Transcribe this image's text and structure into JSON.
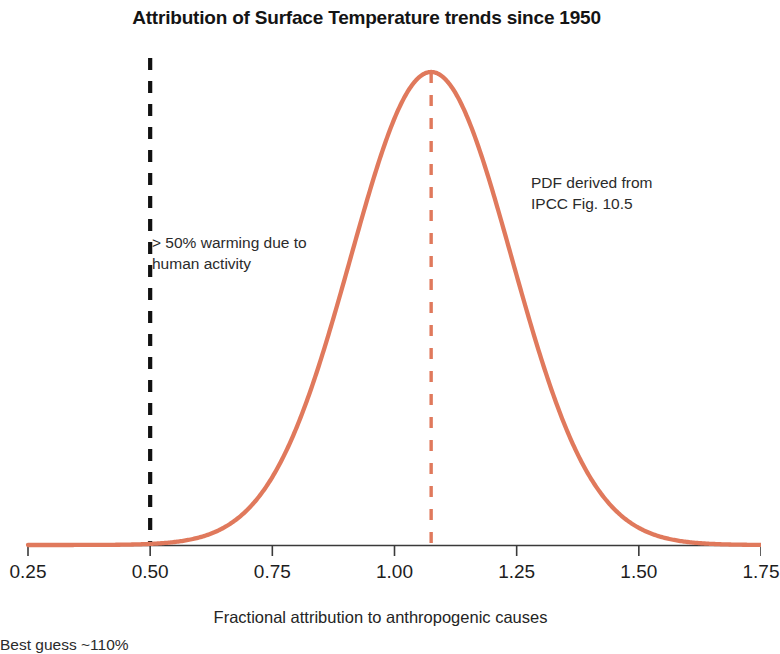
{
  "figure": {
    "title": "Attribution of Surface Temperature trends since 1950",
    "axis_title": "Fractional attribution to anthropogenic causes",
    "annotations": {
      "human": "> 50% warming due to\nhuman activity",
      "pdf_source": "PDF derived from\nIPCC Fig. 10.5",
      "best_guess": "Best guess ~110%"
    }
  },
  "colors": {
    "curve": "#e0795c",
    "best_guess_line": "#e0795c",
    "threshold_line": "#111111",
    "axis": "#3a3a3a",
    "text": "#1a1a1a"
  },
  "chart_data": {
    "type": "line",
    "title": "Attribution of Surface Temperature trends since 1950",
    "xlabel": "Fractional attribution to anthropogenic causes",
    "ylabel": "",
    "xlim": [
      0.25,
      1.75
    ],
    "ylim": [
      0,
      1.05
    ],
    "xticks": [
      "0.25",
      "0.50",
      "0.75",
      "1.00",
      "1.25",
      "1.50",
      "1.75"
    ],
    "xtick_values": [
      0.25,
      0.5,
      0.75,
      1.0,
      1.25,
      1.5,
      1.75
    ],
    "yticks": [],
    "grid": false,
    "legend": null,
    "series": [
      {
        "name": "PDF of fractional attribution",
        "distribution": "gaussian",
        "mean": 1.075,
        "sigma": 0.165,
        "peak_value": 1.0,
        "color": "#e0795c",
        "x": [
          0.25,
          0.3,
          0.35,
          0.4,
          0.45,
          0.5,
          0.55,
          0.6,
          0.65,
          0.7,
          0.75,
          0.8,
          0.85,
          0.9,
          0.95,
          1.0,
          1.05,
          1.075,
          1.1,
          1.15,
          1.2,
          1.25,
          1.3,
          1.35,
          1.4,
          1.45,
          1.5,
          1.55,
          1.6,
          1.65,
          1.7,
          1.75
        ],
        "y": [
          0.0,
          0.0,
          0.001,
          0.002,
          0.005,
          0.011,
          0.024,
          0.048,
          0.09,
          0.157,
          0.253,
          0.378,
          0.523,
          0.671,
          0.799,
          0.897,
          0.989,
          1.0,
          0.989,
          0.926,
          0.825,
          0.698,
          0.558,
          0.42,
          0.295,
          0.193,
          0.118,
          0.067,
          0.035,
          0.017,
          0.008,
          0.003
        ]
      }
    ],
    "vlines": [
      {
        "name": "50% threshold",
        "x": 0.5,
        "style": "dashed",
        "color": "#111111",
        "label": "> 50% warming due to human activity"
      },
      {
        "name": "best guess",
        "x": 1.075,
        "style": "dashed",
        "color": "#e0795c",
        "label": "Best guess ~110%"
      }
    ]
  }
}
